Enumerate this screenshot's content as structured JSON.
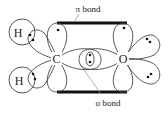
{
  "diagram": {
    "atoms": {
      "carbon": "C",
      "oxygen": "O",
      "hydrogen_top": "H",
      "hydrogen_bottom": "H"
    },
    "labels": {
      "pi_bond": "π bond",
      "sigma_bond": "σ bond"
    },
    "colors": {
      "line": "#444444",
      "bond_bar": "#111111",
      "pointer": "#999999",
      "text": "#222222"
    }
  }
}
